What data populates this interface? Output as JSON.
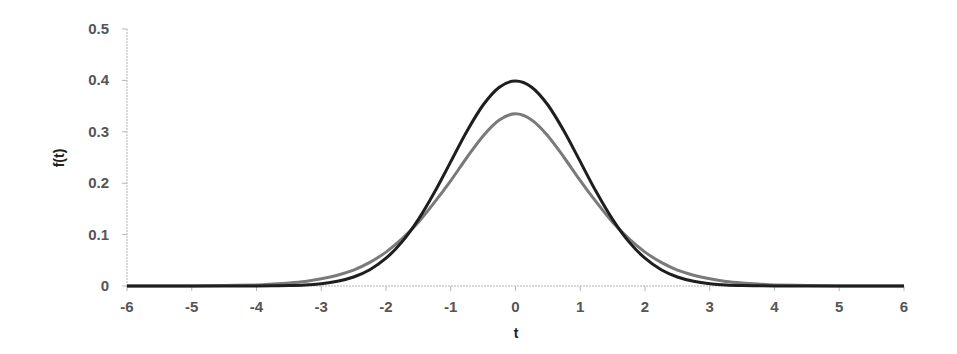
{
  "chart_data": {
    "type": "line",
    "title": "",
    "xlabel": "t",
    "ylabel": "f(t)",
    "xlim": [
      -6,
      6
    ],
    "ylim": [
      0,
      0.5
    ],
    "x_ticks": [
      -6,
      -5,
      -4,
      -3,
      -2,
      -1,
      0,
      1,
      2,
      3,
      4,
      5,
      6
    ],
    "y_ticks": [
      0,
      0.1,
      0.2,
      0.3,
      0.4,
      0.5
    ],
    "x_tick_labels": [
      "-6",
      "-5",
      "-4",
      "-3",
      "-2",
      "-1",
      "0",
      "1",
      "2",
      "3",
      "4",
      "5",
      "6"
    ],
    "y_tick_labels": [
      "0",
      "0.1",
      "0.2",
      "0.3",
      "0.4",
      "0.5"
    ],
    "grid": false,
    "legend": null,
    "x": [
      -6,
      -5.5,
      -5,
      -4.5,
      -4,
      -3.75,
      -3.5,
      -3.25,
      -3,
      -2.75,
      -2.5,
      -2.25,
      -2,
      -1.75,
      -1.5,
      -1.25,
      -1,
      -0.75,
      -0.5,
      -0.25,
      0,
      0.25,
      0.5,
      0.75,
      1,
      1.25,
      1.5,
      1.75,
      2,
      2.25,
      2.5,
      2.75,
      3,
      3.25,
      3.5,
      3.75,
      4,
      4.5,
      5,
      5.5,
      6
    ],
    "series": [
      {
        "name": "standard normal",
        "color": "#1e1e1e",
        "values": [
          0,
          0,
          0,
          0,
          0.0001,
          0.0004,
          0.0009,
          0.002,
          0.0044,
          0.0091,
          0.0175,
          0.0317,
          0.054,
          0.0863,
          0.1295,
          0.1826,
          0.242,
          0.3011,
          0.3521,
          0.3867,
          0.3989,
          0.3867,
          0.3521,
          0.3011,
          0.242,
          0.1826,
          0.1295,
          0.0863,
          0.054,
          0.0317,
          0.0175,
          0.0091,
          0.0044,
          0.002,
          0.0009,
          0.0004,
          0.0001,
          0,
          0,
          0,
          0
        ]
      },
      {
        "name": "t-distribution",
        "color": "#7a7a7a",
        "values": [
          0,
          0,
          0,
          0.001,
          0.002,
          0.004,
          0.006,
          0.009,
          0.014,
          0.021,
          0.031,
          0.046,
          0.066,
          0.092,
          0.124,
          0.163,
          0.205,
          0.25,
          0.292,
          0.323,
          0.335,
          0.323,
          0.292,
          0.25,
          0.205,
          0.163,
          0.124,
          0.092,
          0.066,
          0.046,
          0.031,
          0.021,
          0.014,
          0.009,
          0.006,
          0.004,
          0.002,
          0.001,
          0,
          0,
          0
        ]
      }
    ]
  },
  "layout": {
    "plot_left": 127,
    "plot_right": 904,
    "plot_top": 29,
    "plot_bottom": 286,
    "axis_color": "#b5b5b5"
  }
}
